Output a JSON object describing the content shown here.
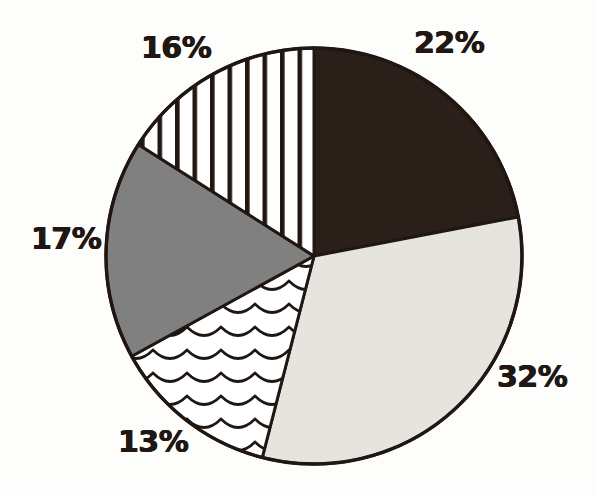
{
  "chart_data": {
    "type": "pie",
    "title": "",
    "subtitle": "",
    "xlabel": "",
    "ylabel": "",
    "grid": false,
    "legend_position": "none",
    "labels_format": "percent",
    "center": {
      "x": 314,
      "y": 256
    },
    "radius": 208,
    "start_angle_deg": 0,
    "direction": "clockwise",
    "categories": [
      "22%",
      "32%",
      "13%",
      "17%",
      "16%"
    ],
    "values": [
      22,
      32,
      13,
      17,
      16
    ],
    "total": 100,
    "slices": [
      {
        "label": "22%",
        "value": 22,
        "angle_deg": 79.2,
        "start_deg": 0,
        "end_deg": 79.2,
        "fill": "#2a1f19",
        "pattern": "solid-dark",
        "label_position": "top-right"
      },
      {
        "label": "32%",
        "value": 32,
        "angle_deg": 115.2,
        "start_deg": 79.2,
        "end_deg": 194.4,
        "fill": "#e6e4df",
        "pattern": "solid-light-gray",
        "label_position": "bottom-right"
      },
      {
        "label": "13%",
        "value": 13,
        "angle_deg": 46.8,
        "start_deg": 194.4,
        "end_deg": 241.2,
        "fill": "#ffffff",
        "pattern": "wavy-scallop",
        "label_position": "bottom-left"
      },
      {
        "label": "17%",
        "value": 17,
        "angle_deg": 61.2,
        "start_deg": 241.2,
        "end_deg": 302.4,
        "fill": "#808080",
        "pattern": "solid-medium-gray",
        "label_position": "left"
      },
      {
        "label": "16%",
        "value": 16,
        "angle_deg": 57.6,
        "start_deg": 302.4,
        "end_deg": 360,
        "fill": "#ffffff",
        "pattern": "vertical-stripes",
        "label_position": "top-left"
      }
    ],
    "colors": {
      "outline": "#201712",
      "slice_dark": "#2a1f19",
      "slice_light_gray": "#e6e4df",
      "slice_medium_gray": "#808080",
      "slice_white": "#ffffff",
      "background": "#fdfdfc",
      "label_text": "#201712"
    }
  },
  "labels": {
    "pct_22": "22%",
    "pct_32": "32%",
    "pct_13": "13%",
    "pct_17": "17%",
    "pct_16": "16%"
  }
}
